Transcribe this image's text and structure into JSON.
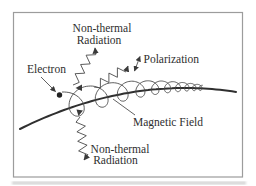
{
  "labels": {
    "radiation_top_line1": "Non-thermal",
    "radiation_top_line2": "Radiation",
    "polarization": "Polarization",
    "electron": "Electron",
    "magnetic_field": "Magnetic Field",
    "radiation_bottom_line1": "Non-thermal",
    "radiation_bottom_line2": "Radiation"
  },
  "colors": {
    "ink": "#3a3a3a",
    "text": "#2e2e2e",
    "frame": "#9c9c9c",
    "background": "#ffffff"
  }
}
